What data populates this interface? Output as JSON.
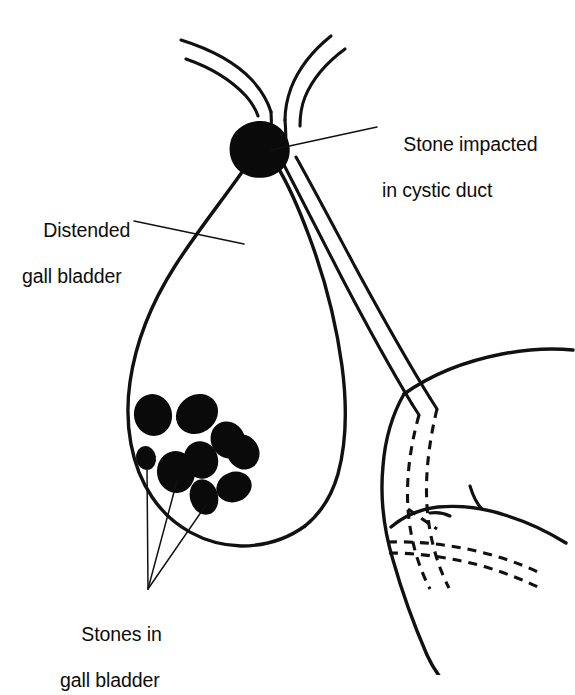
{
  "figure": {
    "ink_color": "#111111",
    "stone_color": "#0a0a0a",
    "background_color": "#ffffff"
  },
  "labels": {
    "stone_impacted": {
      "line1": "Stone impacted",
      "line2": "in cystic duct"
    },
    "distended_gall_bladder": {
      "line1": "Distended",
      "line2": "gall bladder"
    },
    "stones_in_gall_bladder": {
      "line1": "Stones in",
      "line2": "gall bladder"
    }
  },
  "structures": [
    {
      "name": "common-hepatic-duct",
      "style": "solid"
    },
    {
      "name": "left-hepatic-duct-branch",
      "style": "solid"
    },
    {
      "name": "right-hepatic-duct-branch",
      "style": "solid"
    },
    {
      "name": "cystic-duct",
      "style": "solid"
    },
    {
      "name": "gall-bladder",
      "style": "solid"
    },
    {
      "name": "common-bile-duct",
      "style": "solid-then-dashed"
    },
    {
      "name": "duodenum",
      "style": "solid"
    },
    {
      "name": "pancreatic-duct",
      "style": "dashed"
    }
  ],
  "stones": {
    "impacted_count": 1,
    "gall_bladder_count": 9
  }
}
